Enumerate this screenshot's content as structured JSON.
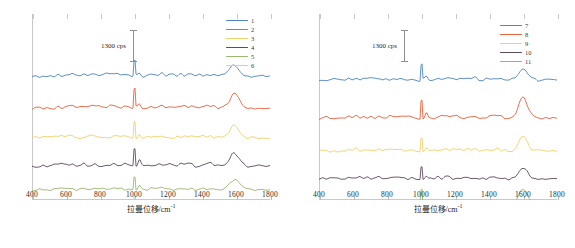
{
  "figure": {
    "type": "raman-spectra-figure",
    "panel_count": 2
  },
  "axis": {
    "x_title_main": "拉曼位移/cm",
    "x_title_sup": "-1",
    "ticks": [
      "400",
      "600",
      "800",
      "1000",
      "1200",
      "1400",
      "1600",
      "1800"
    ],
    "xmin": 400,
    "xmax": 1800
  },
  "scalebar": {
    "label": "1300 cps"
  },
  "left_panel": {
    "name": "left-spectra-panel",
    "legend": [
      {
        "label": "1",
        "color": "#4e85c4"
      },
      {
        "label": "2",
        "color": "#e8603c"
      },
      {
        "label": "3",
        "color": "#f2d06b"
      },
      {
        "label": "4",
        "color": "#5f4a5e"
      },
      {
        "label": "5",
        "color": "#9cb86f"
      },
      {
        "label": "6",
        "color": "#aed9e0"
      }
    ]
  },
  "right_panel": {
    "name": "right-spectra-panel",
    "legend": [
      {
        "label": "7",
        "color": "#4e85c4"
      },
      {
        "label": "8",
        "color": "#e8603c"
      },
      {
        "label": "9",
        "color": "#f2d06b"
      },
      {
        "label": "10",
        "color": "#5f4a5e"
      },
      {
        "label": "11",
        "color": "#9cb86f"
      }
    ]
  },
  "chart_data": {
    "type": "line",
    "title": "",
    "xlabel": "拉曼位移/cm-1",
    "ylabel": "Intensity (cps, offset stacked)",
    "xlim": [
      400,
      1800
    ],
    "grid": false,
    "legend_position": "top-right",
    "annotations": [
      {
        "text": "1300 cps",
        "type": "scale-bar",
        "panel": "left"
      },
      {
        "text": "1300 cps",
        "type": "scale-bar",
        "panel": "right"
      }
    ],
    "panels": [
      {
        "panel": "left",
        "series": [
          {
            "name": "1",
            "color": "#4e85c4",
            "peaks_cm1": [
              620,
              760,
              850,
              1003,
              1155,
              1320,
              1450,
              1580
            ]
          },
          {
            "name": "2",
            "color": "#e8603c",
            "peaks_cm1": [
              620,
              760,
              850,
              1003,
              1155,
              1320,
              1450,
              1590
            ]
          },
          {
            "name": "3",
            "color": "#f2d06b",
            "peaks_cm1": [
              620,
              760,
              850,
              1003,
              1155,
              1320,
              1450,
              1585
            ]
          },
          {
            "name": "4",
            "color": "#5f4a5e",
            "peaks_cm1": [
              620,
              760,
              850,
              1003,
              1155,
              1320,
              1450,
              1585
            ]
          },
          {
            "name": "5",
            "color": "#9cb86f",
            "peaks_cm1": [
              620,
              760,
              850,
              1003,
              1155,
              1320,
              1450,
              1590
            ]
          },
          {
            "name": "6",
            "color": "#aed9e0",
            "peaks_cm1": [
              620,
              760,
              850,
              1003,
              1155,
              1320,
              1450,
              1590
            ]
          }
        ]
      },
      {
        "panel": "right",
        "series": [
          {
            "name": "7",
            "color": "#4e85c4",
            "peaks_cm1": [
              620,
              760,
              850,
              1003,
              1155,
              1320,
              1450,
              1600
            ]
          },
          {
            "name": "8",
            "color": "#e8603c",
            "peaks_cm1": [
              620,
              760,
              850,
              1003,
              1155,
              1320,
              1450,
              1600
            ]
          },
          {
            "name": "9",
            "color": "#f2d06b",
            "peaks_cm1": [
              620,
              760,
              850,
              1003,
              1155,
              1320,
              1450,
              1600
            ]
          },
          {
            "name": "10",
            "color": "#5f4a5e",
            "peaks_cm1": [
              620,
              760,
              850,
              1003,
              1155,
              1320,
              1450,
              1600
            ]
          },
          {
            "name": "11",
            "color": "#9cb86f",
            "peaks_cm1": [
              620,
              760,
              850,
              1003,
              1155,
              1320,
              1450,
              1600
            ]
          }
        ]
      }
    ]
  }
}
